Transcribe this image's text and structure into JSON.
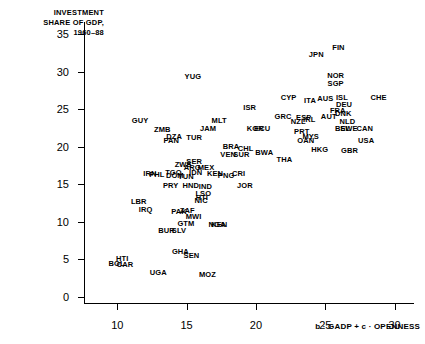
{
  "chart_data": {
    "type": "scatter",
    "title": "",
    "ylabel": "INVESTMENT\nSHARE OF GDP,\n1960–88",
    "xlabel": "b · GADP + c · OPENNESS",
    "xlim": [
      7.6,
      31.4
    ],
    "ylim": [
      -1.0,
      36.6
    ],
    "xticks": [
      10,
      15,
      20,
      25,
      30
    ],
    "yticks": [
      0,
      5,
      10,
      15,
      20,
      25,
      30,
      35
    ],
    "grid": false,
    "legend": null,
    "point_style": "text-label",
    "points": [
      {
        "label": "FIN",
        "x": 25.95,
        "y": 33.1
      },
      {
        "label": "JPN",
        "x": 24.35,
        "y": 32.2
      },
      {
        "label": "NOR",
        "x": 25.75,
        "y": 29.4
      },
      {
        "label": "SGP",
        "x": 25.75,
        "y": 28.4
      },
      {
        "label": "YUG",
        "x": 15.45,
        "y": 29.3
      },
      {
        "label": "CHE",
        "x": 28.85,
        "y": 26.5
      },
      {
        "label": "ISL",
        "x": 26.2,
        "y": 26.5
      },
      {
        "label": "DEU",
        "x": 26.35,
        "y": 25.6
      },
      {
        "label": "AUS",
        "x": 25.0,
        "y": 26.3
      },
      {
        "label": "ITA",
        "x": 23.9,
        "y": 26.1
      },
      {
        "label": "FRA",
        "x": 25.9,
        "y": 24.8
      },
      {
        "label": "CYP",
        "x": 22.35,
        "y": 26.5
      },
      {
        "label": "AUT",
        "x": 25.25,
        "y": 24.0
      },
      {
        "label": "DNK",
        "x": 26.3,
        "y": 24.3
      },
      {
        "label": "NLD",
        "x": 26.6,
        "y": 23.3
      },
      {
        "label": "ISR",
        "x": 19.55,
        "y": 25.2
      },
      {
        "label": "GRC",
        "x": 21.95,
        "y": 23.9
      },
      {
        "label": "ESP",
        "x": 23.45,
        "y": 23.8
      },
      {
        "label": "IRL",
        "x": 23.85,
        "y": 23.6
      },
      {
        "label": "NZL",
        "x": 23.05,
        "y": 23.3
      },
      {
        "label": "BEL",
        "x": 26.25,
        "y": 22.4
      },
      {
        "label": "SWE",
        "x": 26.7,
        "y": 22.3
      },
      {
        "label": "CAN",
        "x": 27.85,
        "y": 22.3
      },
      {
        "label": "USA",
        "x": 27.95,
        "y": 20.8
      },
      {
        "label": "PRT",
        "x": 23.3,
        "y": 21.9
      },
      {
        "label": "MYS",
        "x": 23.95,
        "y": 21.3
      },
      {
        "label": "OAN",
        "x": 23.6,
        "y": 20.8
      },
      {
        "label": "HKG",
        "x": 24.6,
        "y": 19.5
      },
      {
        "label": "GBR",
        "x": 26.75,
        "y": 19.4
      },
      {
        "label": "MLT",
        "x": 17.35,
        "y": 23.4
      },
      {
        "label": "JAM",
        "x": 16.55,
        "y": 22.4
      },
      {
        "label": "KOR",
        "x": 19.95,
        "y": 22.4
      },
      {
        "label": "ECU",
        "x": 20.45,
        "y": 22.4
      },
      {
        "label": "GUY",
        "x": 11.65,
        "y": 23.4
      },
      {
        "label": "ZMB",
        "x": 13.25,
        "y": 22.2
      },
      {
        "label": "DZA",
        "x": 14.1,
        "y": 21.3
      },
      {
        "label": "PAN",
        "x": 13.9,
        "y": 20.8
      },
      {
        "label": "TUR",
        "x": 15.55,
        "y": 21.1
      },
      {
        "label": "BRA",
        "x": 18.2,
        "y": 19.9
      },
      {
        "label": "CHL",
        "x": 19.25,
        "y": 19.7
      },
      {
        "label": "VEN",
        "x": 18.0,
        "y": 18.9
      },
      {
        "label": "SUR",
        "x": 18.95,
        "y": 18.9
      },
      {
        "label": "BWA",
        "x": 20.6,
        "y": 19.1
      },
      {
        "label": "ZWE",
        "x": 14.75,
        "y": 17.6
      },
      {
        "label": "SER",
        "x": 15.55,
        "y": 18.0
      },
      {
        "label": "ARG",
        "x": 15.4,
        "y": 17.2
      },
      {
        "label": "MEX",
        "x": 16.4,
        "y": 17.2
      },
      {
        "label": "TGO",
        "x": 14.05,
        "y": 16.5
      },
      {
        "label": "IDN",
        "x": 15.65,
        "y": 16.5
      },
      {
        "label": "KEN",
        "x": 17.05,
        "y": 16.4
      },
      {
        "label": "PNG",
        "x": 17.85,
        "y": 16.1
      },
      {
        "label": "THA",
        "x": 22.05,
        "y": 18.2
      },
      {
        "label": "CRI",
        "x": 18.75,
        "y": 16.4
      },
      {
        "label": "IRN",
        "x": 12.35,
        "y": 16.3
      },
      {
        "label": "PHL",
        "x": 12.85,
        "y": 16.2
      },
      {
        "label": "DOM",
        "x": 14.15,
        "y": 16.1
      },
      {
        "label": "TUN",
        "x": 14.95,
        "y": 16.0
      },
      {
        "label": "PRY",
        "x": 13.85,
        "y": 14.8
      },
      {
        "label": "HND",
        "x": 15.3,
        "y": 14.7
      },
      {
        "label": "IND",
        "x": 16.35,
        "y": 14.6
      },
      {
        "label": "JOR",
        "x": 19.2,
        "y": 14.7
      },
      {
        "label": "LSO",
        "x": 16.2,
        "y": 13.7
      },
      {
        "label": "HTI",
        "x": 16.1,
        "y": 13.2
      },
      {
        "label": "NIC",
        "x": 16.05,
        "y": 12.7
      },
      {
        "label": "LBR",
        "x": 11.55,
        "y": 12.6
      },
      {
        "label": "IRQ",
        "x": 12.05,
        "y": 11.6
      },
      {
        "label": "PAK",
        "x": 14.45,
        "y": 11.3
      },
      {
        "label": "ZAF",
        "x": 15.05,
        "y": 11.4
      },
      {
        "label": "MWI",
        "x": 15.5,
        "y": 10.6
      },
      {
        "label": "GTM",
        "x": 14.95,
        "y": 9.7
      },
      {
        "label": "NGA",
        "x": 17.2,
        "y": 9.6
      },
      {
        "label": "KEN",
        "x": 17.35,
        "y": 9.5
      },
      {
        "label": "BUR",
        "x": 13.55,
        "y": 8.8
      },
      {
        "label": "SLV",
        "x": 14.45,
        "y": 8.7
      },
      {
        "label": "GHA",
        "x": 14.55,
        "y": 5.9
      },
      {
        "label": "SEN",
        "x": 15.35,
        "y": 5.4
      },
      {
        "label": "HTI",
        "x": 10.35,
        "y": 5.0
      },
      {
        "label": "BOL",
        "x": 9.95,
        "y": 4.3
      },
      {
        "label": "CAR",
        "x": 10.55,
        "y": 4.2
      },
      {
        "label": "UGA",
        "x": 12.95,
        "y": 3.1
      },
      {
        "label": "MOZ",
        "x": 16.5,
        "y": 2.9
      }
    ]
  }
}
